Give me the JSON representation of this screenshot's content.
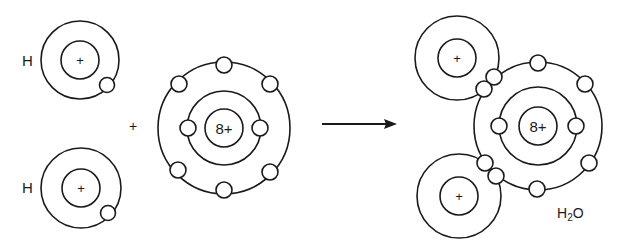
{
  "reactants": {
    "hydrogen_atoms": [
      {
        "label": "H",
        "nucleus_charge": "+",
        "electrons": 1
      },
      {
        "label": "H",
        "nucleus_charge": "+",
        "electrons": 1
      }
    ],
    "plus_sign": "+",
    "oxygen_atom": {
      "nucleus_charge": "8+",
      "inner_shell_electrons": 2,
      "outer_shell_electrons": 6
    }
  },
  "arrow": "reaction-arrow",
  "product": {
    "formula_main": "H",
    "formula_sub": "2",
    "formula_tail": "O",
    "oxygen_nucleus": "8+",
    "hydrogen_nuclei": [
      "+",
      "+"
    ],
    "shared_pairs": 2
  },
  "colors": {
    "line": "#1a1a1a",
    "background": "#ffffff"
  }
}
